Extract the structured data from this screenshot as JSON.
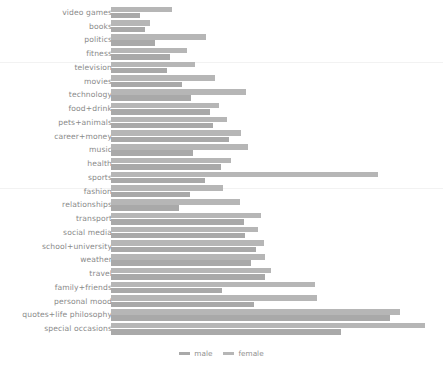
{
  "chart_data": {
    "type": "bar",
    "orientation": "horizontal",
    "title": "",
    "subtitle": "",
    "xlabel": "",
    "ylabel": "",
    "grid": true,
    "legend_position": "bottom-center",
    "bar_style": "grouped-horizontal",
    "categories": [
      "video games",
      "books",
      "politics",
      "fitness",
      "television",
      "movies",
      "technology",
      "food+drink",
      "pets+animals",
      "career+money",
      "music",
      "health",
      "sports",
      "fashion",
      "relationships",
      "transport",
      "social media",
      "school+university",
      "weather",
      "travel",
      "family+friends",
      "personal mood",
      "quotes+life philosophy",
      "special occasions"
    ],
    "series": [
      {
        "name": "female",
        "color": "#b6b6b6",
        "values": [
          18.4,
          11.8,
          28.6,
          22.9,
          25.4,
          31.3,
          40.8,
          32.6,
          34.9,
          39.2,
          41.3,
          36.1,
          80.4,
          33.7,
          38.9,
          45.2,
          44.3,
          46.1,
          46.3,
          48.2,
          61.5,
          61.9,
          87.1,
          94.5
        ]
      },
      {
        "name": "male",
        "color": "#a9a9a9",
        "values": [
          8.8,
          10.2,
          13.4,
          17.9,
          16.8,
          21.4,
          24.1,
          29.8,
          30.6,
          35.4,
          24.7,
          33.1,
          28.4,
          23.9,
          20.5,
          40.1,
          40.5,
          43.7,
          42.2,
          46.5,
          33.4,
          43.0,
          84.1,
          69.3
        ]
      }
    ],
    "xlim": [
      0,
      100
    ],
    "ylim": null,
    "tick_labels_x": [],
    "annotations": []
  },
  "legend": {
    "items": [
      {
        "label": "male",
        "color": "#a9a9a9"
      },
      {
        "label": "female",
        "color": "#b6b6b6"
      }
    ]
  },
  "style": {
    "background": "#ffffff",
    "label_color": "#8a8a8a",
    "gridline_color": "#f2f2f2"
  }
}
